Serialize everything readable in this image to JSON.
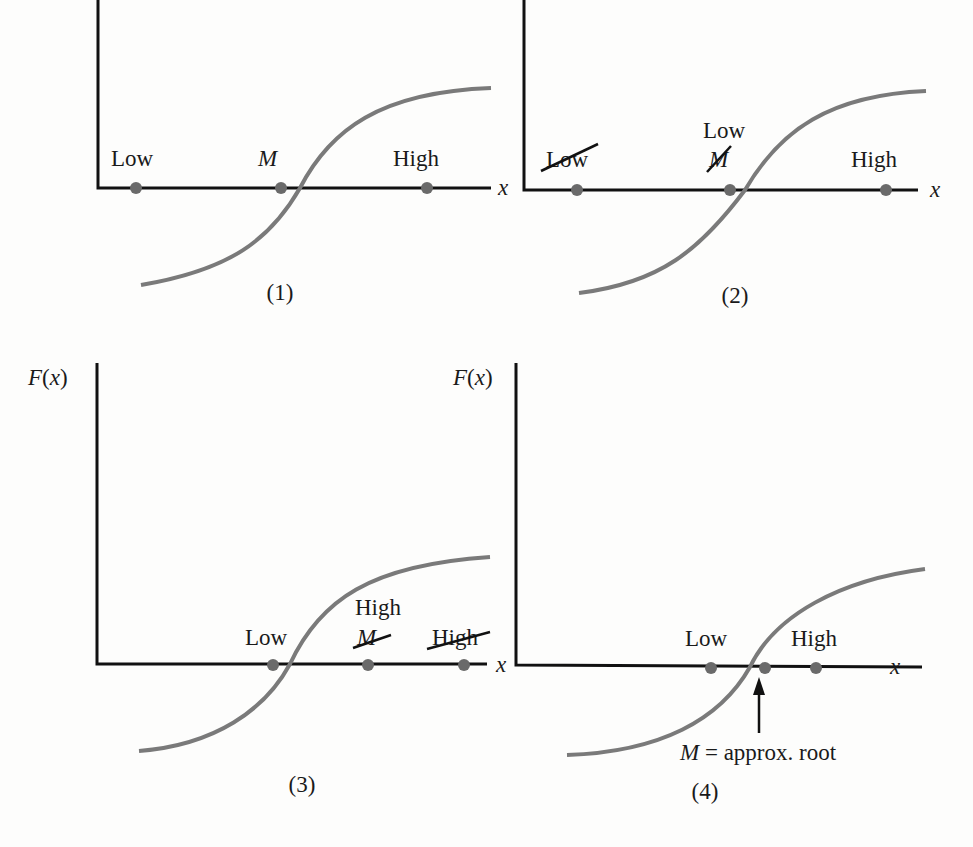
{
  "figure": {
    "axis_labels": {
      "y": "F(x)",
      "x": "x"
    },
    "panels": [
      {
        "caption": "(1)",
        "points": [
          {
            "label": "Low",
            "struck": false
          },
          {
            "label": "M",
            "struck": false,
            "italic": true
          },
          {
            "label": "High",
            "struck": false
          }
        ]
      },
      {
        "caption": "(2)",
        "points": [
          {
            "label": "Low",
            "struck": true
          },
          {
            "label": "M",
            "struck": true,
            "italic": true,
            "replacement": "Low"
          },
          {
            "label": "High",
            "struck": false
          }
        ]
      },
      {
        "caption": "(3)",
        "y_label": "F(x)",
        "points": [
          {
            "label": "Low",
            "struck": false
          },
          {
            "label": "M",
            "struck": true,
            "italic": true,
            "replacement": "High"
          },
          {
            "label": "High",
            "struck": true
          }
        ]
      },
      {
        "caption": "(4)",
        "y_label": "F(x)",
        "points": [
          {
            "label": "Low",
            "struck": false
          },
          {
            "label": "M",
            "struck": false,
            "hidden_label": true
          },
          {
            "label": "High",
            "struck": false
          }
        ],
        "annotation": {
          "var": "M",
          "text": "= approx. root"
        }
      }
    ]
  },
  "colors": {
    "axis": "#111111",
    "curve": "#7a7a7a",
    "dot": "#6a6a6a",
    "text": "#1a1a1a"
  }
}
